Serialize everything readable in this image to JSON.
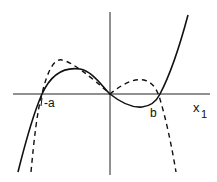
{
  "diagram": {
    "type": "function-plot",
    "axes": {
      "horizontal_label": "x",
      "horizontal_label_subscript": "1",
      "origin": [
        110,
        94
      ]
    },
    "labels": {
      "neg_a": "-a",
      "b": "b"
    },
    "curves": [
      {
        "name": "solid-cubic",
        "style": "solid",
        "description": "cubic through -a, 0, b; rising to the right"
      },
      {
        "name": "dashed-quintic",
        "style": "dashed",
        "description": "passes through -a, 0, b; falls at both ends"
      }
    ],
    "colors": {
      "stroke": "#111111",
      "background": "#ffffff"
    }
  }
}
